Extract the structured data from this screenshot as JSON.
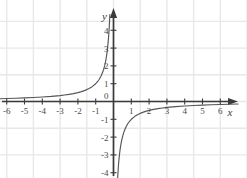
{
  "figure": {
    "title": "",
    "background_color": "#ffffff",
    "width": 247,
    "height": 178
  },
  "chart_data": {
    "type": "line",
    "title": "",
    "subtitle": "",
    "xlabel": "x",
    "ylabel": "y",
    "function": "y = -1/x",
    "xlim": [
      -6.9,
      7.2
    ],
    "ylim": [
      -4.6,
      5.0
    ],
    "grid": true,
    "grid_color": "#e8e8e8",
    "grid_spacing_units": 1.5,
    "legend": null,
    "legend_position": "none",
    "axis_color": "#3b3b3b",
    "curve_color": "#555555",
    "origin_label": "0",
    "x_tick_labels": [
      "-6",
      "-5",
      "-4",
      "-3",
      "-2",
      "-1",
      "1",
      "2",
      "3",
      "4",
      "5",
      "6"
    ],
    "x_tick_values": [
      -6,
      -5,
      -4,
      -3,
      -2,
      -1,
      1,
      2,
      3,
      4,
      5,
      6
    ],
    "y_tick_labels": [
      "4",
      "3",
      "2",
      "1",
      "-1",
      "-2",
      "-3",
      "-4"
    ],
    "y_tick_values": [
      4,
      3,
      2,
      1,
      -1,
      -2,
      -3,
      -4
    ],
    "series": [
      {
        "name": "branch-upper-left",
        "quadrant": "II",
        "x": [
          -6.9,
          -6.5,
          -6.0,
          -5.5,
          -5.0,
          -4.5,
          -4.0,
          -3.5,
          -3.0,
          -2.75,
          -2.5,
          -2.25,
          -2.0,
          -1.8,
          -1.6,
          -1.4,
          -1.2,
          -1.0,
          -0.9,
          -0.8,
          -0.7,
          -0.6,
          -0.55,
          -0.5,
          -0.45,
          -0.4,
          -0.35,
          -0.3,
          -0.26,
          -0.24,
          -0.22,
          -0.205
        ],
        "y": [
          0.145,
          0.154,
          0.167,
          0.182,
          0.2,
          0.222,
          0.25,
          0.286,
          0.333,
          0.364,
          0.4,
          0.444,
          0.5,
          0.556,
          0.625,
          0.714,
          0.833,
          1.0,
          1.111,
          1.25,
          1.429,
          1.667,
          1.818,
          2.0,
          2.222,
          2.5,
          2.857,
          3.333,
          3.846,
          4.167,
          4.545,
          4.878
        ]
      },
      {
        "name": "branch-lower-right",
        "quadrant": "IV",
        "x": [
          0.215,
          0.23,
          0.25,
          0.28,
          0.32,
          0.36,
          0.4,
          0.45,
          0.5,
          0.6,
          0.7,
          0.8,
          0.9,
          1.0,
          1.2,
          1.4,
          1.6,
          1.8,
          2.0,
          2.25,
          2.5,
          2.75,
          3.0,
          3.5,
          4.0,
          4.5,
          5.0,
          5.5,
          6.0,
          6.5,
          7.0
        ],
        "y": [
          -4.651,
          -4.348,
          -4.0,
          -3.571,
          -3.125,
          -2.778,
          -2.5,
          -2.222,
          -2.0,
          -1.667,
          -1.429,
          -1.25,
          -1.111,
          -1.0,
          -0.833,
          -0.714,
          -0.625,
          -0.556,
          -0.5,
          -0.444,
          -0.4,
          -0.364,
          -0.333,
          -0.286,
          -0.25,
          -0.222,
          -0.2,
          -0.182,
          -0.167,
          -0.154,
          -0.143
        ]
      }
    ]
  }
}
